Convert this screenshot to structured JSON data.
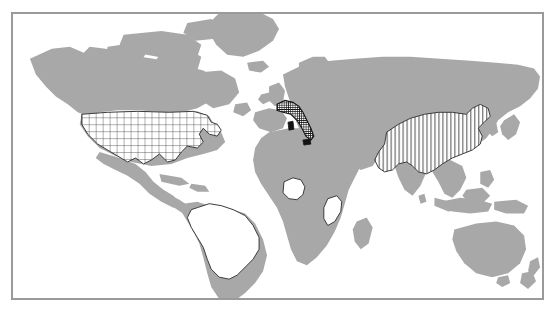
{
  "figure": {
    "type": "world-map",
    "width": 556,
    "height": 318,
    "background_color": "#ffffff",
    "frame": {
      "border_color": "#9a9a9a",
      "border_width": 1,
      "x": 11,
      "y": 12,
      "width": 533,
      "height": 288
    }
  },
  "map": {
    "projection_note": "equirectangular-style world outline",
    "land_color": "#a8a8a8",
    "ocean_color": "#ffffff",
    "outline_color": "#3a3a3a",
    "highlight_fill": "#ffffff",
    "hatch_color": "#3a3a3a",
    "dense_fill": "#1a1a1a"
  },
  "legend": {
    "patterns": [
      {
        "key": "grid",
        "label": "cross-hatch grid"
      },
      {
        "key": "vertical",
        "label": "vertical lines"
      },
      {
        "key": "solid-dark",
        "label": "solid dark"
      },
      {
        "key": "outline",
        "label": "white outline only"
      }
    ]
  },
  "highlighted_countries": [
    {
      "name": "United States",
      "key": "usa",
      "pattern": "grid",
      "fill": "#ffffff",
      "outline": "#3a3a3a",
      "continent": "North America"
    },
    {
      "name": "Brazil",
      "key": "brazil",
      "pattern": "outline",
      "fill": "#ffffff",
      "outline": "#3a3a3a",
      "continent": "South America"
    },
    {
      "name": "Nigeria",
      "key": "nigeria",
      "pattern": "outline",
      "fill": "#ffffff",
      "outline": "#3a3a3a",
      "continent": "Africa"
    },
    {
      "name": "Kenya",
      "key": "kenya",
      "pattern": "outline",
      "fill": "#ffffff",
      "outline": "#3a3a3a",
      "continent": "Africa"
    },
    {
      "name": "Italy",
      "key": "italy",
      "pattern": "solid-dark",
      "fill": "#1a1a1a",
      "outline": "#1a1a1a",
      "continent": "Europe"
    },
    {
      "name": "China",
      "key": "china",
      "pattern": "vertical",
      "fill": "#ffffff",
      "outline": "#3a3a3a",
      "continent": "Asia"
    }
  ],
  "unhighlighted_regions": [
    {
      "name": "Canada",
      "key": "canada"
    },
    {
      "name": "Greenland",
      "key": "greenland"
    },
    {
      "name": "Alaska",
      "key": "alaska"
    },
    {
      "name": "Mexico",
      "key": "mexico"
    },
    {
      "name": "Europe",
      "key": "europe"
    },
    {
      "name": "Russia",
      "key": "russia"
    },
    {
      "name": "Africa",
      "key": "africa"
    },
    {
      "name": "India",
      "key": "india"
    },
    {
      "name": "Southeast Asia",
      "key": "southeast-asia"
    },
    {
      "name": "Australia",
      "key": "australia"
    },
    {
      "name": "New Zealand",
      "key": "new-zealand"
    },
    {
      "name": "Japan",
      "key": "japan"
    },
    {
      "name": "Madagascar",
      "key": "madagascar"
    },
    {
      "name": "Argentina",
      "key": "argentina"
    }
  ]
}
